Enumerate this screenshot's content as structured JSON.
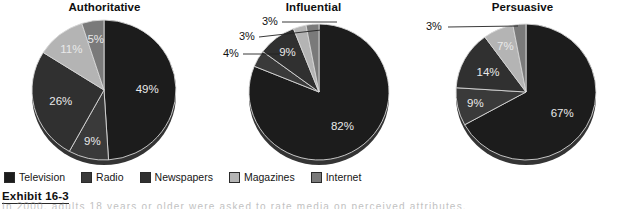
{
  "figure": {
    "exhibit_label": "Exhibit 16-3",
    "caption_text": "In 2000, adults 18 years or older were asked to rate media on perceived attributes."
  },
  "legend": {
    "items": [
      {
        "label": "Television",
        "color": "#1c1c1c"
      },
      {
        "label": "Radio",
        "color": "#3a3a3a"
      },
      {
        "label": "Newspapers",
        "color": "#303030"
      },
      {
        "label": "Magazines",
        "color": "#b4b4b4"
      },
      {
        "label": "Internet",
        "color": "#7a7a7a"
      }
    ]
  },
  "chart_data": [
    {
      "type": "pie",
      "title": "Authoritative",
      "categories": [
        "Television",
        "Radio",
        "Newspapers",
        "Magazines",
        "Internet"
      ],
      "values": [
        49,
        9,
        26,
        11,
        5
      ],
      "labels": [
        "49%",
        "9%",
        "26%",
        "11%",
        "5%"
      ],
      "colors": [
        "#1c1c1c",
        "#3a3a3a",
        "#303030",
        "#b4b4b4",
        "#7a7a7a"
      ],
      "label_placement": [
        "inside",
        "inside",
        "inside",
        "inside",
        "inside"
      ],
      "start_angle": 0,
      "legend_position": "bottom"
    },
    {
      "type": "pie",
      "title": "Influential",
      "categories": [
        "Television",
        "Radio",
        "Newspapers",
        "Magazines",
        "Internet"
      ],
      "values": [
        82,
        4,
        9,
        3,
        3
      ],
      "labels": [
        "82%",
        "4%",
        "9%",
        "3%",
        "3%"
      ],
      "colors": [
        "#1c1c1c",
        "#3a3a3a",
        "#303030",
        "#b4b4b4",
        "#7a7a7a"
      ],
      "label_placement": [
        "inside",
        "outside",
        "inside",
        "outside",
        "outside"
      ],
      "start_angle": 0,
      "legend_position": "bottom"
    },
    {
      "type": "pie",
      "title": "Persuasive",
      "categories": [
        "Television",
        "Radio",
        "Newspapers",
        "Magazines",
        "Internet"
      ],
      "values": [
        67,
        9,
        14,
        7,
        3
      ],
      "labels": [
        "67%",
        "9%",
        "14%",
        "7%",
        "3%"
      ],
      "colors": [
        "#1c1c1c",
        "#3a3a3a",
        "#303030",
        "#b4b4b4",
        "#7a7a7a"
      ],
      "label_placement": [
        "inside",
        "inside",
        "inside",
        "inside",
        "outside"
      ],
      "start_angle": 0,
      "legend_position": "bottom"
    }
  ]
}
